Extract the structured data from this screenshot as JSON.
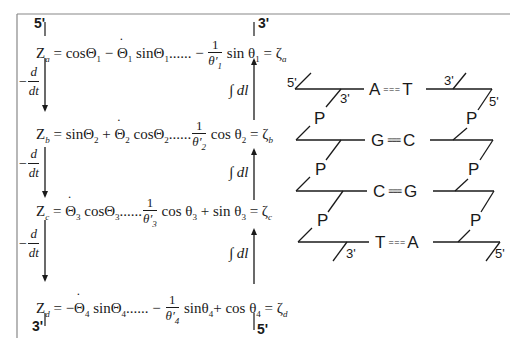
{
  "equations_panel": {
    "top_left_end": "5'",
    "top_right_end": "3'",
    "bottom_left_end": "3'",
    "bottom_right_end": "5'",
    "derivative_label": {
      "prefix": "−",
      "num": "d",
      "den": "dt"
    },
    "integral_label": "∫ dl",
    "rows": [
      {
        "lhs": "Z",
        "lhs_sub": "a",
        "terms_before": "= cosΘ",
        "t1_sub": "1",
        "mid": " − ",
        "dot_theta": "Θ",
        "dot_sub": "1",
        "after_dot": " sinΘ",
        "after_dot_sub": "1",
        "dots": "......",
        "frac_sign": " − ",
        "frac_num": "1",
        "frac_den": "θ′",
        "frac_den_sub": "1",
        "tail": " sin θ",
        "tail_sub": "1",
        "tail2": "",
        "tail2_sub": "",
        "rhs": " = ζ",
        "rhs_sub": "a"
      },
      {
        "lhs": "Z",
        "lhs_sub": "b",
        "terms_before": "= sinΘ",
        "t1_sub": "2",
        "mid": " + ",
        "dot_theta": "Θ",
        "dot_sub": "2",
        "after_dot": " cosΘ",
        "after_dot_sub": "2",
        "dots": "......",
        "frac_sign": "",
        "frac_num": "1",
        "frac_den": "θ′",
        "frac_den_sub": "2",
        "tail": " cos θ",
        "tail_sub": "2",
        "tail2": "",
        "tail2_sub": "",
        "rhs": " = ζ",
        "rhs_sub": "b"
      },
      {
        "lhs": "Z",
        "lhs_sub": "c",
        "terms_before": "= ",
        "t1_sub": "",
        "mid": "",
        "dot_theta": "Θ",
        "dot_sub": "3",
        "after_dot": " cosΘ",
        "after_dot_sub": "3",
        "dots": "......",
        "frac_sign": "",
        "frac_num": "1",
        "frac_den": "θ′",
        "frac_den_sub": "3",
        "tail": " cos θ",
        "tail_sub": "3",
        "tail2": " + sin θ",
        "tail2_sub": "3",
        "rhs": " = ζ",
        "rhs_sub": "c"
      },
      {
        "lhs": "Z",
        "lhs_sub": "d",
        "terms_before": "= −",
        "t1_sub": "",
        "mid": "",
        "dot_theta": "Θ",
        "dot_sub": "4",
        "after_dot": " sinΘ",
        "after_dot_sub": "4",
        "dots": "......",
        "frac_sign": " − ",
        "frac_num": "1",
        "frac_den": "θ′",
        "frac_den_sub": "4",
        "tail": " sinθ",
        "tail_sub": "4",
        "tail2": "+ cos θ",
        "tail2_sub": "4",
        "rhs": " = ζ",
        "rhs_sub": "d"
      }
    ]
  },
  "dna_panel": {
    "left_strand_top_end": "5'",
    "left_strand_bottom_end": "3'",
    "right_strand_top_end": "3'",
    "right_strand_bottom_end": "5'",
    "left_inner_top_end": "3'",
    "right_inner_top_end": "5'",
    "phosphate_label": "P",
    "base_pairs": [
      {
        "left": "A",
        "bond": "= = =",
        "right": "T",
        "bond_type": "double"
      },
      {
        "left": "G",
        "bond": "≡≡≡",
        "right": "C",
        "bond_type": "triple"
      },
      {
        "left": "C",
        "bond": "≡≡≡",
        "right": "G",
        "bond_type": "triple"
      },
      {
        "left": "T",
        "bond": "= = =",
        "right": "A",
        "bond_type": "double"
      }
    ]
  },
  "colors": {
    "ink": "#1a1a1a",
    "frame": "#888888",
    "background": "#ffffff"
  }
}
